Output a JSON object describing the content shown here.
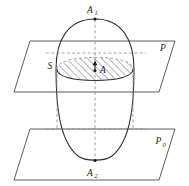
{
  "figure": {
    "background_color": "#ffffff",
    "line_color": "#2b2b2b",
    "plane_line_color": "#4a4a4a",
    "dash_color": "#8d8d8d",
    "labels": {
      "top_vertex": "A",
      "top_vertex_sub": "1",
      "bottom_vertex": "A",
      "bottom_vertex_sub": "2",
      "cross_section_center": "A",
      "cross_section_region": "S",
      "upper_plane": "P",
      "lower_plane": "P",
      "lower_plane_sub": "0"
    },
    "geometry": {
      "axis_x": 95,
      "top_vertex_y": 18,
      "bottom_vertex_y": 162,
      "upper_plane_cut_y": 69,
      "lower_plane_cut_y": 133,
      "ellipse_half_width": 39,
      "cross_section_rx": 38,
      "cross_section_ry": 11,
      "hatch_angle_deg": 45
    }
  }
}
